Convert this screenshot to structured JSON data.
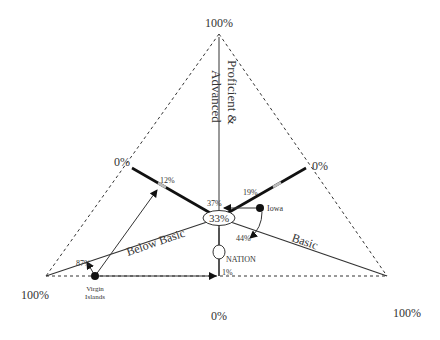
{
  "diagram": {
    "type": "ternary",
    "vertices": {
      "top": {
        "label": "100%"
      },
      "bottom_left": {
        "label": "100%"
      },
      "bottom_right": {
        "label": "100%"
      }
    },
    "zero_labels": {
      "left": "0%",
      "right": "0%",
      "bottom": "0%"
    },
    "axes": {
      "proficient_advanced": "Proficient &",
      "proficient_advanced_2": "Advanced",
      "below_basic": "Below Basic",
      "basic": "Basic"
    },
    "center_label": "33%",
    "nation_label": "NATION",
    "iowa": {
      "label": "Iowa",
      "proficient_advanced": "37%",
      "below_basic_mark": "19%",
      "basic": "44%"
    },
    "virgin_islands": {
      "label_line1": "Virgin",
      "label_line2": "Islands",
      "below_basic": "87%",
      "mark_12": "12%",
      "mark_1": "1%"
    }
  }
}
